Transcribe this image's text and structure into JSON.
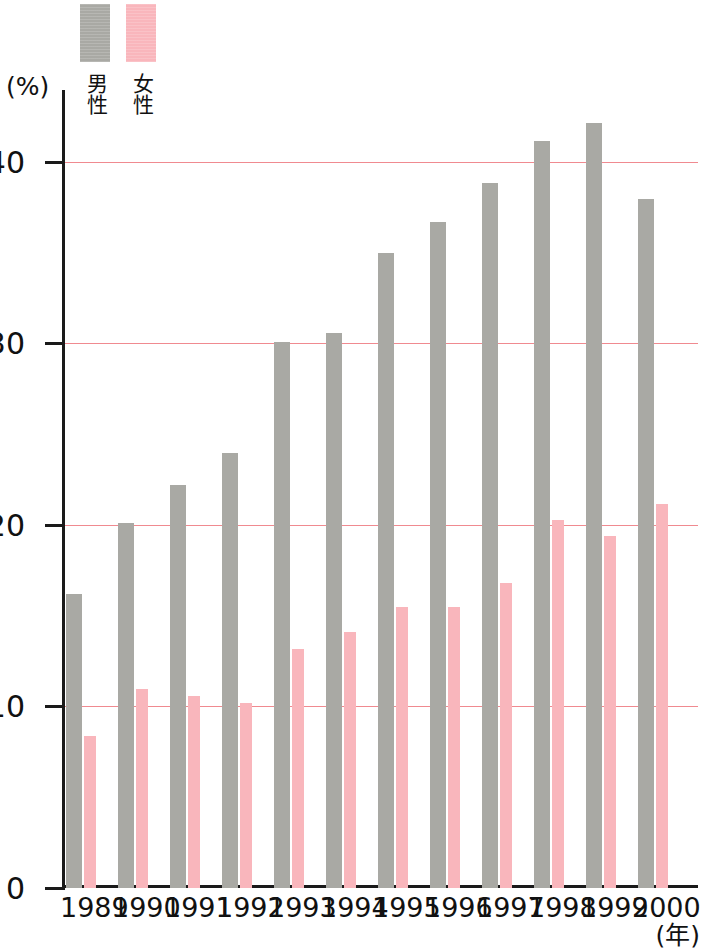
{
  "chart_data": {
    "type": "bar",
    "title": "",
    "xlabel": "(年)",
    "ylabel": "(%)",
    "ylim": [
      0,
      44
    ],
    "yticks": [
      0,
      10,
      20,
      30,
      40
    ],
    "ytick_labels": [
      "0",
      "10",
      "20",
      "30",
      "40"
    ],
    "grid": "horizontal gridlines at 10, 20, 30, 40 (pink)",
    "legend_position": "top-left above plot",
    "categories": [
      "1989",
      "1990",
      "1991",
      "1992",
      "1993",
      "1994",
      "1995",
      "1996",
      "1997",
      "1998",
      "1999",
      "2000"
    ],
    "series": [
      {
        "name": "男性",
        "color": "#a9a9a4",
        "values": [
          16.2,
          20.1,
          22.2,
          24.0,
          30.1,
          30.6,
          35.0,
          36.7,
          38.9,
          41.2,
          42.2,
          38.0
        ]
      },
      {
        "name": "女性",
        "color": "#f9b6bc",
        "values": [
          8.4,
          11.0,
          10.6,
          10.2,
          13.2,
          14.1,
          15.5,
          15.5,
          16.8,
          20.3,
          19.4,
          21.2
        ]
      }
    ]
  },
  "axes": {
    "y_unit": "(%)",
    "x_unit": "(年)"
  },
  "legend": {
    "entries": [
      {
        "label": "男性",
        "swatch": "male-swatch"
      },
      {
        "label": "女性",
        "swatch": "female-swatch"
      }
    ]
  },
  "colors": {
    "male": "#a9a9a4",
    "female": "#f9b6bc",
    "gridline": "#f08a90",
    "axis": "#1a1a1a",
    "background": "#ffffff"
  }
}
